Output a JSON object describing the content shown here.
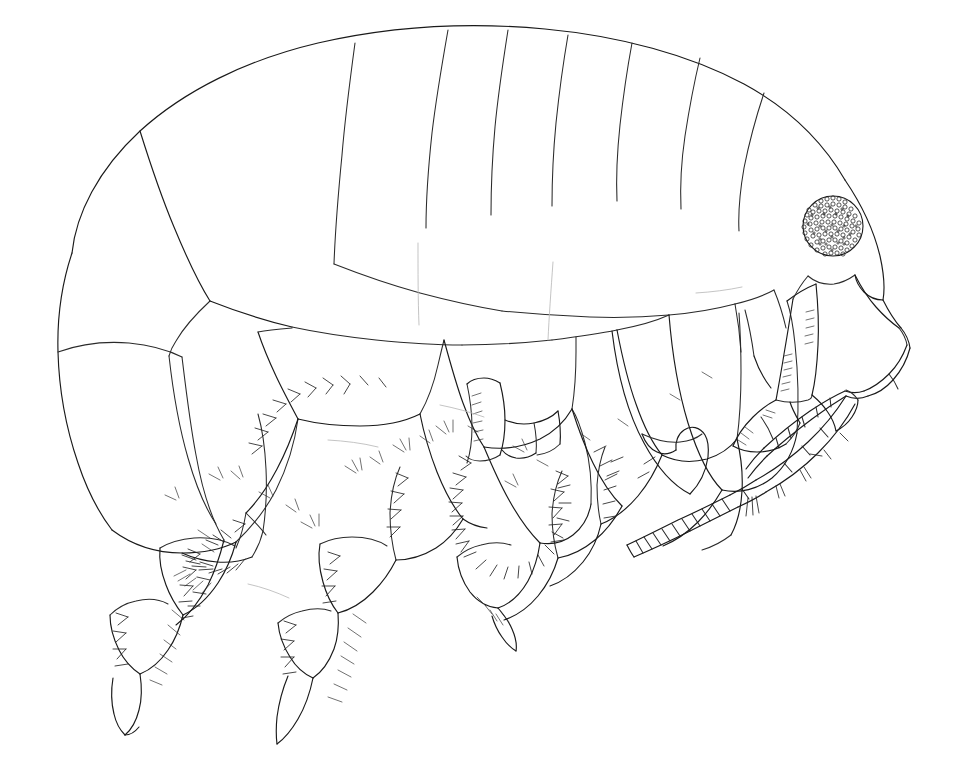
{
  "figure": {
    "domain": "Natural-Image",
    "view": "lateral",
    "style": "scientific-ink-line-drawing",
    "background_color": "#ffffff",
    "line_color": "#1a1a1a",
    "faint_line_color": "#b9b9b9",
    "caption": "",
    "title": "",
    "labels": [],
    "canvas": {
      "width": 953,
      "height": 773
    }
  },
  "anatomy": {
    "eye": {
      "name": "compound-eye",
      "center_x": 833,
      "center_y": 226,
      "radius": 30,
      "texture": "stippled-ommatidia",
      "fill_color": "#ffffff",
      "stroke_color": "#1a1a1a"
    },
    "regions": [
      {
        "id": "head",
        "label": "head"
      },
      {
        "id": "pereon",
        "label": "pereon"
      },
      {
        "id": "pleon",
        "label": "pleon"
      },
      {
        "id": "urosome",
        "label": "urosome"
      },
      {
        "id": "antenna-1",
        "label": "antenna 1"
      },
      {
        "id": "antenna-2",
        "label": "antenna 2"
      },
      {
        "id": "gnathopod-1",
        "label": "gnathopod 1"
      },
      {
        "id": "gnathopod-2",
        "label": "gnathopod 2"
      },
      {
        "id": "pereopods",
        "label": "pereopods"
      },
      {
        "id": "coxal-plates",
        "label": "coxal plates"
      },
      {
        "id": "uropods",
        "label": "uropods"
      }
    ]
  }
}
